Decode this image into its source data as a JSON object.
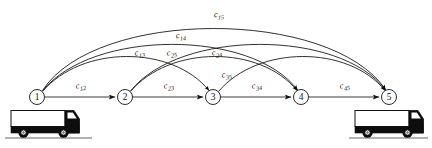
{
  "figure": {
    "background_color": "#ffffff",
    "line_color": "#1a1a1a",
    "node_fill": "#ffffff",
    "truck_color": "#0d0d0d"
  },
  "nodes": [
    {
      "id": "1",
      "label": "1",
      "x": 37,
      "y": 97,
      "r": 7.5
    },
    {
      "id": "2",
      "label": "2",
      "x": 125,
      "y": 97,
      "r": 7.5
    },
    {
      "id": "3",
      "label": "3",
      "x": 213,
      "y": 97,
      "r": 7.5
    },
    {
      "id": "4",
      "label": "4",
      "x": 301,
      "y": 97,
      "r": 7.5
    },
    {
      "id": "5",
      "label": "5",
      "x": 389,
      "y": 97,
      "r": 7.5
    }
  ],
  "edges": [
    {
      "id": "c12",
      "from": "1",
      "to": "2",
      "base": "c",
      "sub": "12",
      "label": "c12",
      "label_x": 81,
      "label_y": 88,
      "kind": "straight"
    },
    {
      "id": "c23",
      "from": "2",
      "to": "3",
      "base": "c",
      "sub": "23",
      "label": "c23",
      "label_x": 169,
      "label_y": 88,
      "kind": "straight"
    },
    {
      "id": "c34",
      "from": "3",
      "to": "4",
      "base": "c",
      "sub": "34",
      "label": "c34",
      "label_x": 257,
      "label_y": 88,
      "kind": "straight"
    },
    {
      "id": "c45",
      "from": "4",
      "to": "5",
      "base": "c",
      "sub": "45",
      "label": "c45",
      "label_x": 345,
      "label_y": 88,
      "kind": "straight"
    },
    {
      "id": "c13",
      "from": "1",
      "to": "3",
      "base": "c",
      "sub": "13",
      "label": "c13",
      "label_x": 140,
      "label_y": 55,
      "kind": "arc"
    },
    {
      "id": "c24",
      "from": "2",
      "to": "4",
      "base": "c",
      "sub": "24",
      "label": "c24",
      "label_x": 217,
      "label_y": 55,
      "kind": "arc"
    },
    {
      "id": "c35",
      "from": "3",
      "to": "5",
      "base": "c",
      "sub": "35",
      "label": "c35",
      "label_x": 227,
      "label_y": 77,
      "kind": "arc"
    },
    {
      "id": "c14",
      "from": "1",
      "to": "4",
      "base": "c",
      "sub": "14",
      "label": "c14",
      "label_x": 181,
      "label_y": 38,
      "kind": "arc"
    },
    {
      "id": "c25",
      "from": "2",
      "to": "5",
      "base": "c",
      "sub": "25",
      "label": "c25",
      "label_x": 172,
      "label_y": 55,
      "kind": "arc"
    },
    {
      "id": "c15",
      "from": "1",
      "to": "5",
      "base": "c",
      "sub": "15",
      "label": "c15",
      "label_x": 219,
      "label_y": 17,
      "kind": "arc"
    }
  ],
  "trucks": [
    {
      "id": "origin-truck",
      "x": 8,
      "y": 108,
      "facing": "right"
    },
    {
      "id": "destination-truck",
      "x": 352,
      "y": 108,
      "facing": "right"
    }
  ]
}
